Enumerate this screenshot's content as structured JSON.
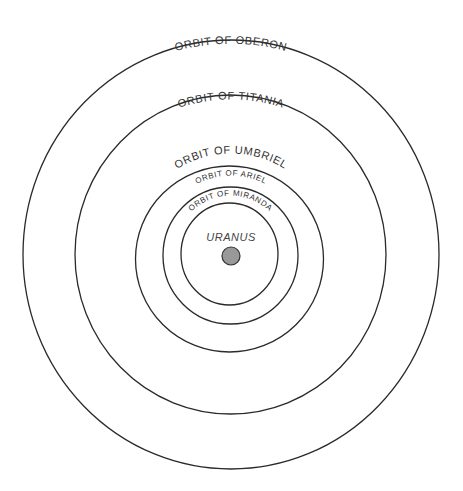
{
  "planet": {
    "label": "URANUS",
    "fill_color": "#999999"
  },
  "orbits": [
    {
      "moon": "Oberon",
      "label": "ORBIT OF OBERON"
    },
    {
      "moon": "Titania",
      "label": "ORBIT OF TITANIA"
    },
    {
      "moon": "Umbriel",
      "label": "ORBIT OF UMBRIEL"
    },
    {
      "moon": "Ariel",
      "label": "ORBIT OF ARIEL"
    },
    {
      "moon": "Miranda",
      "label": "ORBIT OF MIRANDA"
    }
  ],
  "colors": {
    "line": "#2a2a2a",
    "text": "#333333",
    "background": "#ffffff"
  }
}
